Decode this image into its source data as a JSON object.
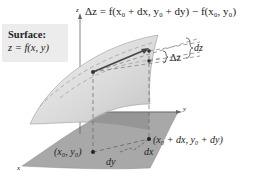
{
  "diagram": {
    "surface_label": {
      "title": "Surface:",
      "equation": "z = f(x, y)"
    },
    "formula": "Δz = f(x₀ + dx, y₀ + dy) − f(x₀, y₀)",
    "axes": {
      "x": "x",
      "y": "y",
      "z": "z"
    },
    "annotations": {
      "delta_z": "Δz",
      "dz": "dz",
      "dx": "dx",
      "dy": "dy",
      "point_base": "(x₀, y₀)",
      "point_shifted": "(x₀ + dx, y₀ + dy)"
    },
    "colors": {
      "surface_fill": "#d8d8d8",
      "plane_fill": "#a9a9a9",
      "line": "#444444",
      "label_box": "#ececec"
    }
  }
}
